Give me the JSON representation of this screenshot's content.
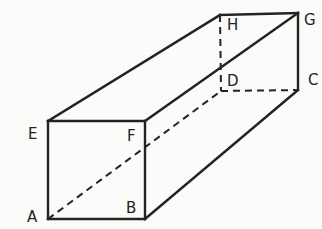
{
  "diagram": {
    "type": "rectangular-prism",
    "vertices": {
      "A": {
        "label": "A",
        "x": 48,
        "y": 219,
        "lx": 27,
        "ly": 222
      },
      "B": {
        "label": "B",
        "x": 145,
        "y": 219,
        "lx": 126,
        "ly": 213
      },
      "C": {
        "label": "C",
        "x": 298,
        "y": 90,
        "lx": 308,
        "ly": 85
      },
      "D": {
        "label": "D",
        "x": 221,
        "y": 91,
        "lx": 227,
        "ly": 86
      },
      "E": {
        "label": "E",
        "x": 48,
        "y": 121,
        "lx": 28,
        "ly": 139
      },
      "F": {
        "label": "F",
        "x": 145,
        "y": 121,
        "lx": 127,
        "ly": 141
      },
      "G": {
        "label": "G",
        "x": 298,
        "y": 13,
        "lx": 304,
        "ly": 25
      },
      "H": {
        "label": "H",
        "x": 220,
        "y": 15,
        "lx": 227,
        "ly": 30
      }
    },
    "solid_edges": [
      [
        "A",
        "B"
      ],
      [
        "B",
        "F"
      ],
      [
        "F",
        "E"
      ],
      [
        "E",
        "A"
      ],
      [
        "E",
        "H"
      ],
      [
        "H",
        "G"
      ],
      [
        "F",
        "G"
      ],
      [
        "G",
        "C"
      ],
      [
        "B",
        "C"
      ]
    ],
    "hidden_edges": [
      [
        "A",
        "D"
      ],
      [
        "D",
        "C"
      ],
      [
        "H",
        "D"
      ]
    ],
    "colors": {
      "line": "#232323",
      "background": "#fbfbfa"
    }
  }
}
